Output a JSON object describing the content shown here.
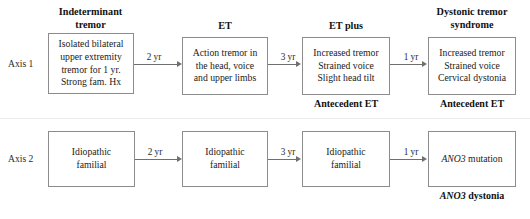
{
  "diagram": {
    "title_present": false,
    "axes": [
      {
        "id": "axis-1",
        "label": "Axis 1"
      },
      {
        "id": "axis-2",
        "label": "Axis 2"
      }
    ],
    "row1": {
      "nodes": [
        {
          "id": "indeterminant-tremor",
          "header": "Indeterminant\ntremor",
          "body": "Isolated bilateral\nupper extremity\ntremor for 1 yr.\nStrong fam. Hx",
          "caption": ""
        },
        {
          "id": "et",
          "header": "ET",
          "body": "Action tremor in\nthe head, voice\nand upper limbs",
          "caption": ""
        },
        {
          "id": "et-plus",
          "header": "ET plus",
          "body": "Increased tremor\nStrained voice\nSlight head tilt",
          "caption": "Antecedent ET"
        },
        {
          "id": "dystonic-tremor-syndrome",
          "header": "Dystonic tremor\nsyndrome",
          "body": "Increased tremor\nStrained voice\nCervical dystonia",
          "caption": "Antecedent ET"
        }
      ],
      "arrows": [
        {
          "id": "arrow-r1-1",
          "label": "2 yr"
        },
        {
          "id": "arrow-r1-2",
          "label": "3 yr"
        },
        {
          "id": "arrow-r1-3",
          "label": "1 yr"
        }
      ]
    },
    "row2": {
      "nodes": [
        {
          "id": "idiopathic-familial-1",
          "header": "",
          "body": "Idiopathic\nfamilial",
          "caption": ""
        },
        {
          "id": "idiopathic-familial-2",
          "header": "",
          "body": "Idiopathic\nfamilial",
          "caption": ""
        },
        {
          "id": "idiopathic-familial-3",
          "header": "",
          "body": "Idiopathic\nfamilial",
          "caption": ""
        },
        {
          "id": "ano3-mutation",
          "header": "",
          "body_gene": "ANO3",
          "body_rest": " mutation",
          "caption_gene": "ANO3",
          "caption_rest": " dystonia"
        }
      ],
      "arrows": [
        {
          "id": "arrow-r2-1",
          "label": "2 yr"
        },
        {
          "id": "arrow-r2-2",
          "label": "3 yr"
        },
        {
          "id": "arrow-r2-3",
          "label": "1 yr"
        }
      ]
    },
    "colors": {
      "box_border": "#8c8c8c",
      "arrow": "#6f6f6f",
      "text": "#1a1a1a",
      "background": "#ffffff",
      "divider": "#ededed"
    }
  }
}
